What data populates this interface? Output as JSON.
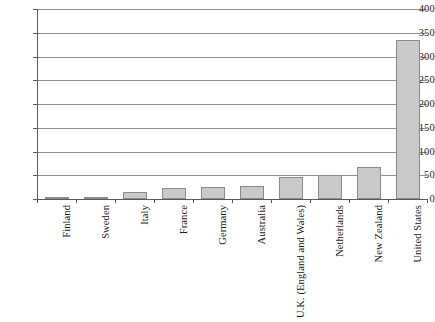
{
  "chart_data": {
    "type": "bar",
    "title": "",
    "subtitle": "",
    "xlabel": "",
    "ylabel": "",
    "ylim": [
      0,
      400
    ],
    "ytick_step": 50,
    "yticks": [
      "400",
      "350",
      "300",
      "250",
      "200",
      "150",
      "100",
      "50",
      "0"
    ],
    "ytick_values": [
      400,
      350,
      300,
      250,
      200,
      150,
      100,
      50,
      0
    ],
    "grid": true,
    "legend": "none",
    "categories": [
      "Finland",
      "Sweden",
      "Italy",
      "France",
      "Germany",
      "Australia",
      "U.K. (England and Wales)",
      "Netherlands",
      "New Zealand",
      "United States"
    ],
    "values": [
      3,
      3,
      15,
      23,
      25,
      27,
      47,
      50,
      67,
      335
    ],
    "series": [
      {
        "name": "",
        "values": [
          3,
          3,
          15,
          23,
          25,
          27,
          47,
          50,
          67,
          335
        ]
      }
    ],
    "colors": {
      "bar_fill": "#c9c9c9",
      "bar_stroke": "#8a8a8a",
      "gridline": "#8e8e8e",
      "axis": "#5a5a5a",
      "text": "#1a1a1a",
      "background": "#ffffff"
    }
  }
}
